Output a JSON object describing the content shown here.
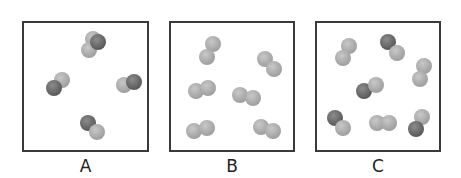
{
  "atom_colors": {
    "dark": "#666666",
    "light": "#a8a8a8"
  },
  "panels": [
    {
      "label": "A",
      "x": 22,
      "width": 127,
      "molecules": [
        {
          "atoms": [
            {
              "x": 61,
              "y": 8,
              "c": "light"
            },
            {
              "x": 57,
              "y": 19,
              "c": "light"
            },
            {
              "x": 66,
              "y": 11,
              "c": "dark"
            }
          ]
        },
        {
          "atoms": [
            {
              "x": 30,
              "y": 49,
              "c": "light"
            },
            {
              "x": 22,
              "y": 57,
              "c": "dark"
            }
          ]
        },
        {
          "atoms": [
            {
              "x": 92,
              "y": 54,
              "c": "light"
            },
            {
              "x": 102,
              "y": 51,
              "c": "dark"
            }
          ]
        },
        {
          "atoms": [
            {
              "x": 56,
              "y": 92,
              "c": "dark"
            },
            {
              "x": 65,
              "y": 101,
              "c": "light"
            }
          ]
        }
      ]
    },
    {
      "label": "B",
      "x": 169,
      "width": 126,
      "molecules": [
        {
          "atoms": [
            {
              "x": 34,
              "y": 13,
              "c": "light"
            },
            {
              "x": 28,
              "y": 26,
              "c": "light"
            }
          ]
        },
        {
          "atoms": [
            {
              "x": 86,
              "y": 28,
              "c": "light"
            },
            {
              "x": 95,
              "y": 38,
              "c": "light"
            }
          ]
        },
        {
          "atoms": [
            {
              "x": 17,
              "y": 60,
              "c": "light"
            },
            {
              "x": 29,
              "y": 57,
              "c": "light"
            }
          ]
        },
        {
          "atoms": [
            {
              "x": 61,
              "y": 64,
              "c": "light"
            },
            {
              "x": 74,
              "y": 67,
              "c": "light"
            }
          ]
        },
        {
          "atoms": [
            {
              "x": 15,
              "y": 100,
              "c": "light"
            },
            {
              "x": 28,
              "y": 97,
              "c": "light"
            }
          ]
        },
        {
          "atoms": [
            {
              "x": 82,
              "y": 96,
              "c": "light"
            },
            {
              "x": 94,
              "y": 100,
              "c": "light"
            }
          ]
        }
      ]
    },
    {
      "label": "C",
      "x": 315,
      "width": 126,
      "molecules": [
        {
          "atoms": [
            {
              "x": 24,
              "y": 15,
              "c": "light"
            },
            {
              "x": 18,
              "y": 27,
              "c": "light"
            }
          ]
        },
        {
          "atoms": [
            {
              "x": 63,
              "y": 11,
              "c": "dark"
            },
            {
              "x": 72,
              "y": 22,
              "c": "light"
            }
          ]
        },
        {
          "atoms": [
            {
              "x": 99,
              "y": 35,
              "c": "light"
            },
            {
              "x": 95,
              "y": 48,
              "c": "light"
            }
          ]
        },
        {
          "atoms": [
            {
              "x": 39,
              "y": 60,
              "c": "dark"
            },
            {
              "x": 51,
              "y": 54,
              "c": "light"
            }
          ]
        },
        {
          "atoms": [
            {
              "x": 10,
              "y": 87,
              "c": "dark"
            },
            {
              "x": 18,
              "y": 97,
              "c": "light"
            }
          ]
        },
        {
          "atoms": [
            {
              "x": 52,
              "y": 92,
              "c": "light"
            },
            {
              "x": 64,
              "y": 92,
              "c": "light"
            }
          ]
        },
        {
          "atoms": [
            {
              "x": 97,
              "y": 86,
              "c": "light"
            },
            {
              "x": 91,
              "y": 98,
              "c": "dark"
            }
          ]
        }
      ]
    }
  ]
}
